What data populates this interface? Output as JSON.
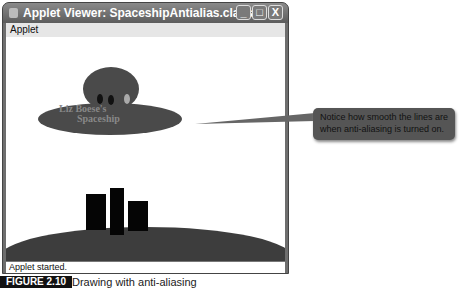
{
  "window": {
    "title": "Applet Viewer: SpaceshipAntialias.class",
    "buttons": {
      "minimize": "_",
      "maximize": "□",
      "close": "X"
    }
  },
  "menubar": {
    "items": [
      {
        "label": "Applet"
      }
    ]
  },
  "canvas": {
    "ship_text_line1": "Liz Boese's",
    "ship_text_line2": "Spaceship",
    "colors": {
      "ship": "#4a4a4a",
      "ground": "#3d3d3d",
      "buildings": "#050505",
      "window_light": "#aaaaaa"
    }
  },
  "statusbar": {
    "text": "Applet started."
  },
  "callout": {
    "text": "Notice how smooth the lines are when anti-aliasing is turned on."
  },
  "caption": {
    "label": "FIGURE 2.10",
    "text": "Drawing with anti-aliasing"
  }
}
